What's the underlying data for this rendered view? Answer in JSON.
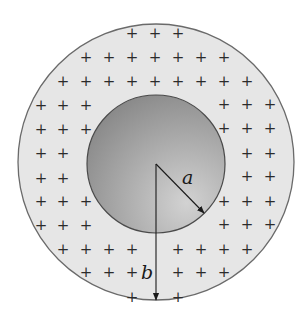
{
  "figure": {
    "outer_region": {
      "label": "b",
      "center": [
        156,
        162
      ],
      "radius": 138,
      "fill": "#e6e6e6",
      "stroke": "#6a6a6a"
    },
    "inner_sphere": {
      "label": "a",
      "center": [
        156,
        164
      ],
      "radius": 69,
      "fill_light": "#d2d2d2",
      "fill_dark": "#8a8a8a",
      "stroke": "#4a4a4a"
    },
    "radius_a_arrow": {
      "from": [
        156,
        164
      ],
      "to": [
        204,
        213
      ],
      "label": "a",
      "label_pos": [
        182,
        184
      ]
    },
    "radius_b_arrow": {
      "from": [
        156,
        164
      ],
      "to": [
        156,
        300
      ],
      "label": "b",
      "label_pos": [
        141,
        279
      ]
    },
    "charge_symbol": "+",
    "charges": [
      [
        132,
        33
      ],
      [
        155,
        33
      ],
      [
        178,
        33
      ],
      [
        86,
        57
      ],
      [
        109,
        57
      ],
      [
        132,
        57
      ],
      [
        155,
        57
      ],
      [
        178,
        57
      ],
      [
        201,
        57
      ],
      [
        224,
        57
      ],
      [
        63,
        81
      ],
      [
        86,
        81
      ],
      [
        109,
        81
      ],
      [
        132,
        81
      ],
      [
        155,
        81
      ],
      [
        178,
        81
      ],
      [
        201,
        81
      ],
      [
        224,
        81
      ],
      [
        247,
        81
      ],
      [
        41,
        105
      ],
      [
        63,
        105
      ],
      [
        86,
        105
      ],
      [
        224,
        104
      ],
      [
        247,
        104
      ],
      [
        270,
        104
      ],
      [
        41,
        129
      ],
      [
        63,
        129
      ],
      [
        86,
        129
      ],
      [
        224,
        128
      ],
      [
        247,
        128
      ],
      [
        270,
        128
      ],
      [
        41,
        153
      ],
      [
        63,
        153
      ],
      [
        247,
        153
      ],
      [
        270,
        153
      ],
      [
        41,
        178
      ],
      [
        63,
        178
      ],
      [
        247,
        176
      ],
      [
        270,
        176
      ],
      [
        41,
        201
      ],
      [
        63,
        201
      ],
      [
        86,
        201
      ],
      [
        224,
        201
      ],
      [
        247,
        201
      ],
      [
        270,
        201
      ],
      [
        41,
        225
      ],
      [
        63,
        225
      ],
      [
        86,
        225
      ],
      [
        224,
        224
      ],
      [
        247,
        224
      ],
      [
        270,
        224
      ],
      [
        63,
        249
      ],
      [
        86,
        249
      ],
      [
        109,
        249
      ],
      [
        132,
        249
      ],
      [
        178,
        249
      ],
      [
        201,
        249
      ],
      [
        224,
        249
      ],
      [
        247,
        249
      ],
      [
        86,
        272
      ],
      [
        109,
        272
      ],
      [
        132,
        272
      ],
      [
        178,
        272
      ],
      [
        201,
        272
      ],
      [
        224,
        272
      ],
      [
        132,
        297
      ],
      [
        178,
        297
      ]
    ]
  }
}
